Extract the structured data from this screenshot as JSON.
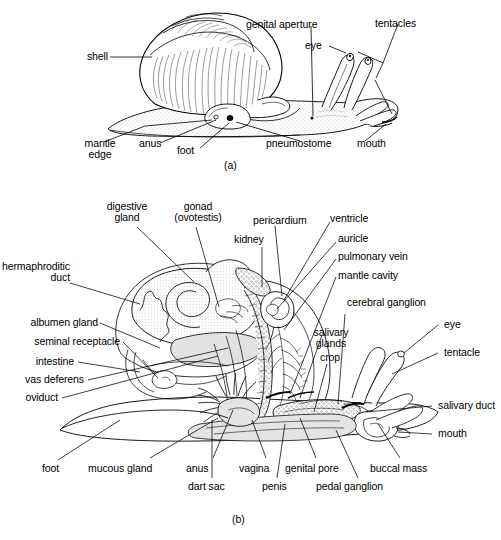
{
  "figure": {
    "panels": [
      {
        "id": "a",
        "caption": "(a)",
        "description": "External anatomy of a land snail in lateral view",
        "labels": [
          {
            "name": "shell",
            "text": "shell"
          },
          {
            "name": "genital-aperture",
            "text": "genital aperture"
          },
          {
            "name": "tentacles",
            "text": "tentacles"
          },
          {
            "name": "eye",
            "text": "eye"
          },
          {
            "name": "mantle-edge",
            "text": "mantle",
            "text2": "edge"
          },
          {
            "name": "anus",
            "text": "anus"
          },
          {
            "name": "foot",
            "text": "foot"
          },
          {
            "name": "pneumostome",
            "text": "pneumostome"
          },
          {
            "name": "mouth",
            "text": "mouth"
          }
        ]
      },
      {
        "id": "b",
        "caption": "(b)",
        "description": "Internal anatomy of a land snail, dissected lateral view",
        "labels": [
          {
            "name": "digestive-gland",
            "text": "digestive",
            "text2": "gland"
          },
          {
            "name": "gonad-ovotestis",
            "text": "gonad",
            "text2": "(ovotestis)"
          },
          {
            "name": "pericardium",
            "text": "pericardium"
          },
          {
            "name": "ventricle",
            "text": "ventricle"
          },
          {
            "name": "kidney",
            "text": "kidney"
          },
          {
            "name": "auricle",
            "text": "auricle"
          },
          {
            "name": "pulmonary-vein",
            "text": "pulmonary vein"
          },
          {
            "name": "mantle-cavity",
            "text": "mantle cavity"
          },
          {
            "name": "hermaphroditic-duct",
            "text": "hermaphroditic",
            "text2": "duct"
          },
          {
            "name": "cerebral-ganglion",
            "text": "cerebral ganglion"
          },
          {
            "name": "albumen-gland",
            "text": "albumen gland"
          },
          {
            "name": "salivary-glands",
            "text": "salivary",
            "text2": "glands"
          },
          {
            "name": "eye",
            "text": "eye"
          },
          {
            "name": "seminal-receptacle",
            "text": "seminal receptacle"
          },
          {
            "name": "crop",
            "text": "crop"
          },
          {
            "name": "tentacle",
            "text": "tentacle"
          },
          {
            "name": "intestine",
            "text": "intestine"
          },
          {
            "name": "vas-deferens",
            "text": "vas deferens"
          },
          {
            "name": "oviduct",
            "text": "oviduct"
          },
          {
            "name": "salivary-duct",
            "text": "salivary duct"
          },
          {
            "name": "mouth",
            "text": "mouth"
          },
          {
            "name": "foot",
            "text": "foot"
          },
          {
            "name": "mucous-gland",
            "text": "mucous gland"
          },
          {
            "name": "anus",
            "text": "anus"
          },
          {
            "name": "vagina",
            "text": "vagina"
          },
          {
            "name": "genital-pore",
            "text": "genital pore"
          },
          {
            "name": "buccal-mass",
            "text": "buccal mass"
          },
          {
            "name": "dart-sac",
            "text": "dart sac"
          },
          {
            "name": "penis",
            "text": "penis"
          },
          {
            "name": "pedal-ganglion",
            "text": "pedal ganglion"
          }
        ]
      }
    ]
  },
  "colors": {
    "ink": "#000000",
    "background": "#ffffff",
    "fill_light": "#f0f0ee",
    "fill_mid": "#dedede",
    "stipple": "#7a7a7a"
  }
}
